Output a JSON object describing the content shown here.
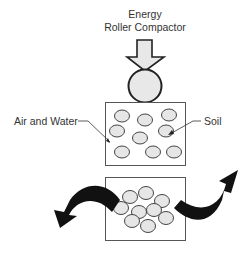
{
  "title": {
    "line1": "Energy",
    "line2": "Roller Compactor"
  },
  "labels": {
    "air_water": "Air and Water",
    "soil": "Soil"
  },
  "colors": {
    "stroke": "#222222",
    "particle_fill": "#e6e6e6",
    "roller_fill": "#e8e8e8",
    "arrow_fill": "#e8e8e8",
    "curved_arrow": "#111111",
    "box_stroke": "#555555"
  },
  "diagram": {
    "loose_state": {
      "particles": 9,
      "description": "Soil particles with air and water voids"
    },
    "compacted_state": {
      "particles": 9,
      "description": "Densely packed soil particles, air and water expelled"
    }
  }
}
